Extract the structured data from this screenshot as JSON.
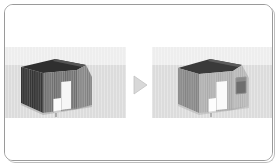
{
  "figure": {
    "kind": "before-after-3d-model-comparison",
    "caption": "",
    "arrow_icon": "play-triangle-icon",
    "arrow_label": "",
    "colors": {
      "frame_border": "#9a9a9a",
      "frame_shadow": "#bdbdbd",
      "canvas_background": "#ffffff",
      "band_sky": "#eeeeee",
      "band_ground": "#dcdcdc",
      "arrow_fill": "#d8d8d8",
      "arrow_stroke": "#c2c2c2"
    }
  },
  "panels": [
    {
      "id": "before",
      "name": "before-panel",
      "label": "",
      "house": {
        "name": "house-model-before",
        "style": "dark-gray-timber-shed",
        "elements": [
          {
            "name": "roof-face",
            "label": "",
            "fill": "#2f2f2f"
          },
          {
            "name": "side-wall-left",
            "label": "",
            "fill": "#4a4a4a"
          },
          {
            "name": "front-wall",
            "label": "",
            "fill": "#7e7e7e"
          },
          {
            "name": "gable-wall-right",
            "label": "",
            "fill": "#8a8a8a"
          },
          {
            "name": "door-panel",
            "label": "",
            "fill": "#f6f6f6"
          },
          {
            "name": "step-panel",
            "label": "",
            "fill": "#fbfbfb"
          }
        ],
        "window_count": 0
      }
    },
    {
      "id": "after",
      "name": "after-panel",
      "label": "",
      "house": {
        "name": "house-model-after",
        "style": "light-gray-timber-shed",
        "elements": [
          {
            "name": "roof-face",
            "label": "",
            "fill": "#3a3a3a"
          },
          {
            "name": "side-wall-left",
            "label": "",
            "fill": "#9a9a9a"
          },
          {
            "name": "front-wall",
            "label": "",
            "fill": "#b4b4b4"
          },
          {
            "name": "gable-wall-right",
            "label": "",
            "fill": "#bdbdbd"
          },
          {
            "name": "door-panel",
            "label": "",
            "fill": "#fafafa"
          },
          {
            "name": "step-panel",
            "label": "",
            "fill": "#fdfdfd"
          },
          {
            "name": "window-panel",
            "label": "",
            "fill": "#6e6e6e"
          }
        ],
        "window_count": 1
      }
    }
  ]
}
